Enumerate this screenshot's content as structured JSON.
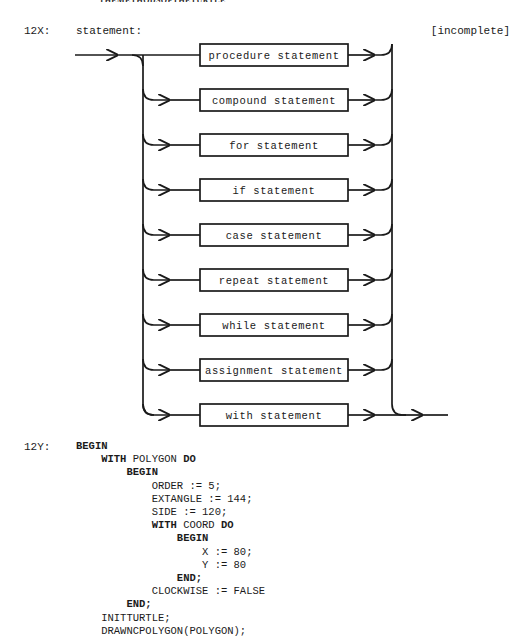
{
  "running_head": "THEMETHODSOFTHETURTLE",
  "figure": {
    "number_label": "12X:",
    "title": "statement:",
    "note": "[incomplete]",
    "boxes": [
      "procedure statement",
      "compound statement",
      "for statement",
      "if statement",
      "case statement",
      "repeat statement",
      "while statement",
      "assignment statement",
      "with statement"
    ]
  },
  "listing": {
    "number_label": "12Y:",
    "lines": [
      {
        "indent": 0,
        "segments": [
          {
            "t": "BEGIN",
            "b": true
          }
        ]
      },
      {
        "indent": 4,
        "segments": [
          {
            "t": "WITH ",
            "b": true
          },
          {
            "t": "POLYGON ",
            "b": false
          },
          {
            "t": "DO",
            "b": true
          }
        ]
      },
      {
        "indent": 8,
        "segments": [
          {
            "t": "BEGIN",
            "b": true
          }
        ]
      },
      {
        "indent": 12,
        "segments": [
          {
            "t": "ORDER := 5;",
            "b": false
          }
        ]
      },
      {
        "indent": 12,
        "segments": [
          {
            "t": "EXTANGLE := 144;",
            "b": false
          }
        ]
      },
      {
        "indent": 12,
        "segments": [
          {
            "t": "SIDE := 120;",
            "b": false
          }
        ]
      },
      {
        "indent": 12,
        "segments": [
          {
            "t": "WITH ",
            "b": true
          },
          {
            "t": "COORD ",
            "b": false
          },
          {
            "t": "DO",
            "b": true
          }
        ]
      },
      {
        "indent": 16,
        "segments": [
          {
            "t": "BEGIN",
            "b": true
          }
        ]
      },
      {
        "indent": 20,
        "segments": [
          {
            "t": "X := 80;",
            "b": false
          }
        ]
      },
      {
        "indent": 20,
        "segments": [
          {
            "t": "Y := 80",
            "b": false
          }
        ]
      },
      {
        "indent": 16,
        "segments": [
          {
            "t": "END;",
            "b": true
          }
        ]
      },
      {
        "indent": 12,
        "segments": [
          {
            "t": "CLOCKWISE := FALSE",
            "b": false
          }
        ]
      },
      {
        "indent": 8,
        "segments": [
          {
            "t": "END;",
            "b": true
          }
        ]
      },
      {
        "indent": 4,
        "segments": [
          {
            "t": "INITTURTLE;",
            "b": false
          }
        ]
      },
      {
        "indent": 4,
        "segments": [
          {
            "t": "DRAWNCPOLYGON(POLYGON);",
            "b": false
          }
        ]
      }
    ]
  },
  "diagram_geometry": {
    "stroke": "#1a1a1a",
    "entry_x": 75,
    "entry_arrow_x": 143,
    "left_rail_x": 143,
    "box_left": 200,
    "box_right": 348,
    "box_height": 22,
    "first_row_y": 55,
    "row_gap": 45,
    "right_rail_x": 392,
    "exit_x": 448,
    "corner_r": 11
  }
}
